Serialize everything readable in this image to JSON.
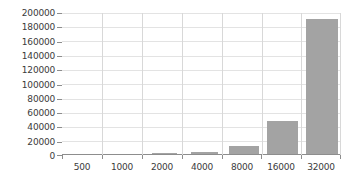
{
  "chart_data": {
    "type": "bar",
    "title": "",
    "subtitle": "",
    "xlabel": "",
    "ylabel": "",
    "categories": [
      "500",
      "1000",
      "2000",
      "4000",
      "8000",
      "16000",
      "32000"
    ],
    "values": [
      0,
      700,
      1400,
      2200,
      11000,
      46500,
      191000
    ],
    "series": [
      {
        "name": "",
        "values": [
          0,
          700,
          1400,
          2200,
          11000,
          46500,
          191000
        ]
      }
    ],
    "ylim": [
      0,
      200000
    ],
    "ytick_labels": [
      "200000",
      "180000",
      "160000",
      "140000",
      "120000",
      "100000",
      "80000",
      "60000",
      "40000",
      "20000",
      "0"
    ],
    "ytick_values": [
      200000,
      180000,
      160000,
      140000,
      120000,
      100000,
      80000,
      60000,
      40000,
      20000,
      0
    ],
    "ytick_interval": 20000,
    "grid": {
      "horizontal": true,
      "vertical": true
    },
    "legend": {
      "visible": false,
      "position": "none",
      "entries": []
    },
    "colors": {
      "bar": "#a3a3a3",
      "grid": "#e3e3e3",
      "vertical_grid": "#d8d8d8",
      "axis": "#8d8d8d",
      "text": "#3b3b3b",
      "background": "#ffffff"
    },
    "annotations": []
  }
}
